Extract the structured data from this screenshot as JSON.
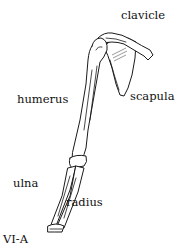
{
  "figure": {
    "id_label": "VI-A",
    "labels": {
      "clavicle": "clavicle",
      "humerus": "humerus",
      "scapula": "scapula",
      "ulna": "ulna",
      "radius": "radius"
    }
  },
  "colors": {
    "background": "#ffffff",
    "ink": "#1a1a1a"
  }
}
